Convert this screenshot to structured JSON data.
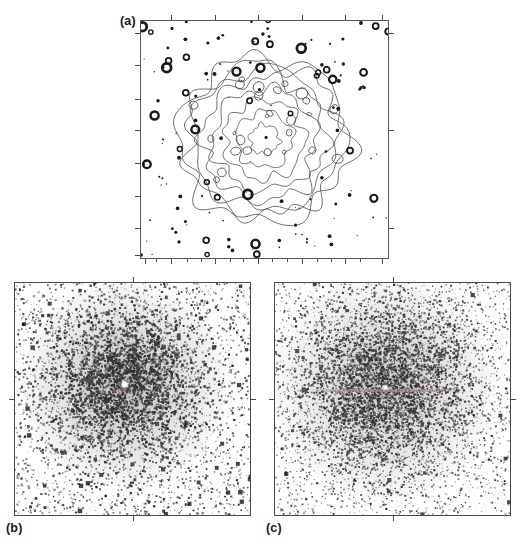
{
  "figure": {
    "kind": "multi-panel-astronomical-figure",
    "background_color": "#ffffff",
    "width": 529,
    "height": 544,
    "panel_count": 3
  },
  "panels": [
    {
      "id": "a",
      "label": "(a)",
      "type": "contour-map",
      "description": "Isointensity contour map of an extended diffuse source with numerous compact point sources scattered across the field",
      "frame": {
        "x": 140,
        "y": 20,
        "width": 249,
        "height": 239
      },
      "frame_color": "#585858",
      "contour_color": "#4d4d4d",
      "source_color": "#1a1a1a",
      "contour_levels": 8,
      "ticks": {
        "top_major": [
          0.125,
          0.3,
          0.475,
          0.65,
          0.825,
          0.97
        ],
        "bottom_major": [
          0.02,
          0.125,
          0.3,
          0.475,
          0.65,
          0.825,
          0.97
        ],
        "bottom_minor": [
          0.065,
          0.19,
          0.245,
          0.36,
          0.415,
          0.53,
          0.59,
          0.71,
          0.765,
          0.885
        ],
        "left_major": [
          0.055,
          0.19,
          0.33,
          0.46,
          0.6,
          0.735,
          0.87,
          0.985
        ],
        "right_major": [
          0.055,
          0.46,
          0.87
        ]
      }
    },
    {
      "id": "b",
      "label": "(b)",
      "type": "photon-scatter-image",
      "description": "Raw photon event map, high contrast, clumpy asymmetric core with a bright unresolved central peak",
      "frame": {
        "x": 14,
        "y": 282,
        "width": 237,
        "height": 234
      },
      "frame_color": "#4a4a4a",
      "point_color": "#151515",
      "core_center": [
        0.465,
        0.44
      ],
      "core_radius": 0.3,
      "core_density": "high",
      "background_density": "moderate",
      "central_peak_color": "#ffffff",
      "tint_color": "#8a5a4a",
      "ticks": {
        "top_major": [
          0.5
        ],
        "bottom_major": [
          0.5
        ],
        "left_major": [
          0.5
        ],
        "right_major": [
          0.5
        ]
      }
    },
    {
      "id": "c",
      "label": "(c)",
      "type": "photon-scatter-image",
      "description": "Smoothed/model photon event map, rounder and more uniform core with a faint horizontal streak through the centre",
      "frame": {
        "x": 274,
        "y": 282,
        "width": 237,
        "height": 234
      },
      "frame_color": "#4a4a4a",
      "point_color": "#1b1b1b",
      "core_center": [
        0.47,
        0.45
      ],
      "core_radius": 0.33,
      "core_density": "medium",
      "background_density": "moderate",
      "central_peak_color": "#ffffff",
      "streak_color": "#b08a88",
      "ticks": {
        "top_major": [
          0.5
        ],
        "bottom_major": [
          0.5
        ],
        "left_major": [
          0.5
        ],
        "right_major": [
          0.5
        ]
      }
    }
  ],
  "chart_data": {
    "type": "scatter",
    "title": "",
    "xlabel": "",
    "ylabel": "",
    "grid": false,
    "legend": null,
    "panels": [
      {
        "panel": "a",
        "type": "contour",
        "n_contour_levels": 8,
        "n_point_sources": 168,
        "centroid": [
          0.5,
          0.5
        ],
        "outer_contour_radius": 0.37
      },
      {
        "panel": "b",
        "type": "scatter",
        "n_points_core": 4200,
        "n_points_background": 2600,
        "core_center": [
          0.465,
          0.44
        ],
        "core_radius": 0.3
      },
      {
        "panel": "c",
        "type": "scatter",
        "n_points_core": 5200,
        "n_points_background": 2400,
        "core_center": [
          0.47,
          0.45
        ],
        "core_radius": 0.33
      }
    ]
  }
}
